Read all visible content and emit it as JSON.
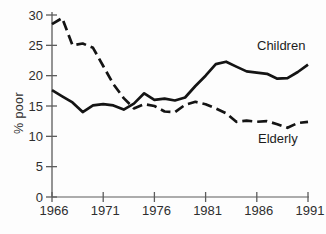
{
  "figure": {
    "background": "#fdfdfd",
    "line_color": "#141414",
    "axis_color": "#5c5c5c",
    "text_color": "#2e2e2e"
  },
  "chart_data": {
    "type": "line",
    "title": "",
    "xlabel": "",
    "ylabel": "% poor",
    "xlim": [
      1966,
      1991
    ],
    "ylim": [
      0,
      30
    ],
    "xticks": [
      1966,
      1971,
      1976,
      1981,
      1986,
      1991
    ],
    "yticks": [
      0,
      5,
      10,
      15,
      20,
      25,
      30
    ],
    "grid": false,
    "legend_position": "inline-annotations",
    "x": [
      1966,
      1967,
      1968,
      1969,
      1970,
      1971,
      1972,
      1973,
      1974,
      1975,
      1976,
      1977,
      1978,
      1979,
      1980,
      1981,
      1982,
      1983,
      1984,
      1985,
      1986,
      1987,
      1988,
      1989,
      1990,
      1991
    ],
    "series": [
      {
        "name": "Children",
        "style": "solid",
        "values": [
          17.6,
          16.6,
          15.6,
          14.0,
          15.1,
          15.3,
          15.1,
          14.4,
          15.4,
          17.1,
          16.0,
          16.2,
          15.9,
          16.4,
          18.3,
          20.0,
          21.9,
          22.3,
          21.5,
          20.7,
          20.5,
          20.3,
          19.5,
          19.6,
          20.6,
          21.8
        ]
      },
      {
        "name": "Elderly",
        "style": "dashed",
        "values": [
          28.5,
          29.5,
          25.0,
          25.3,
          24.6,
          21.6,
          18.6,
          16.3,
          14.6,
          15.3,
          15.0,
          14.1,
          14.0,
          15.2,
          15.7,
          15.3,
          14.6,
          13.8,
          12.4,
          12.6,
          12.4,
          12.5,
          12.0,
          11.4,
          12.2,
          12.4
        ]
      }
    ]
  }
}
